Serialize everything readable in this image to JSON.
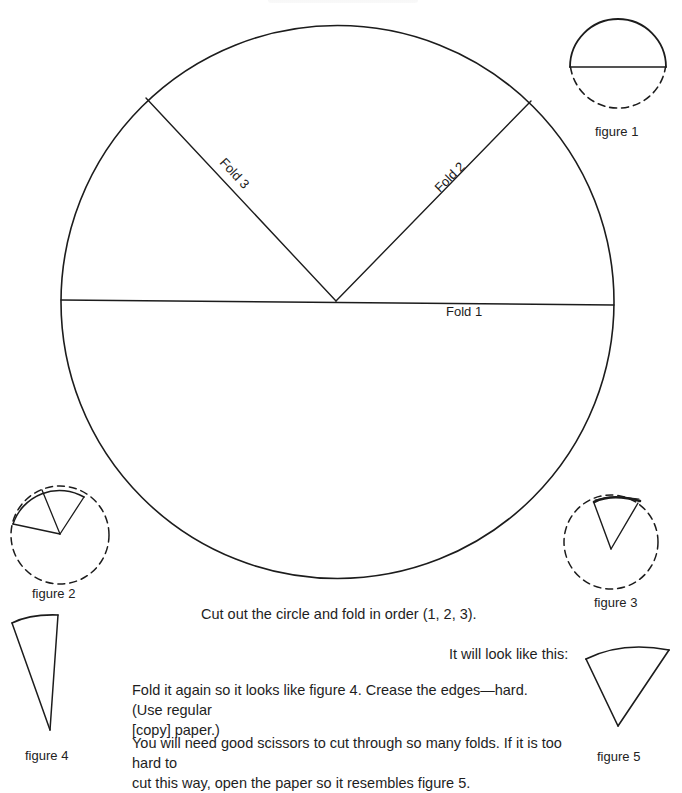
{
  "page": {
    "type": "printed-worksheet",
    "background": "#ffffff",
    "ink_color": "#1c1c1c"
  },
  "main_circle": {
    "labels": {
      "fold1": "Fold 1",
      "fold2": "Fold 2",
      "fold3": "Fold 3"
    }
  },
  "figures": [
    {
      "id": "figure1",
      "caption": "figure 1"
    },
    {
      "id": "figure2",
      "caption": "figure 2"
    },
    {
      "id": "figure3",
      "caption": "figure 3"
    },
    {
      "id": "figure4",
      "caption": "figure 4"
    },
    {
      "id": "figure5",
      "caption": "figure 5"
    }
  ],
  "instructions": {
    "step1": "Cut out the circle and fold in order (1, 2, 3).",
    "look_like": "It will look like this:",
    "step2_line1": "Fold it again so it looks like figure 4. Crease the edges—hard. (Use regular",
    "step2_line2": "[copy] paper.)",
    "step3_line1": "You will need good scissors to cut through so many folds. If it is too hard to",
    "step3_line2": "cut this way, open the paper so it resembles figure 5."
  }
}
